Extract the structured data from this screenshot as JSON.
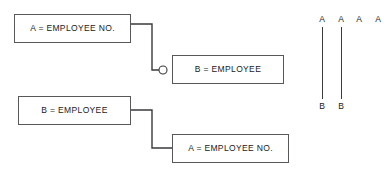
{
  "figure": {
    "name": "entity-relationship-figure",
    "background_color": "#ffffff",
    "line_color": "#3a3a3c",
    "box_border_color": "#58585a",
    "text_color": "#1a1a1a"
  },
  "diagrams": [
    {
      "name": "relationship-diagram-one",
      "parent_box": {
        "label": "A = EMPLOYEE NO.",
        "x": 14,
        "y": 14,
        "width": 117,
        "height": 29
      },
      "child_box": {
        "label": "B = EMPLOYEE",
        "x": 172,
        "y": 55,
        "width": 112,
        "height": 29
      },
      "connector": {
        "path": "M 131 24 L 152 24 L 152 70 L 163 70",
        "marker": {
          "type": "open-circle",
          "cx": 163,
          "cy": 70,
          "r": 4
        }
      }
    },
    {
      "name": "relationship-diagram-two",
      "parent_box": {
        "label": "B = EMPLOYEE",
        "x": 18,
        "y": 96,
        "width": 113,
        "height": 29
      },
      "child_box": {
        "label": "A = EMPLOYEE NO.",
        "x": 172,
        "y": 134,
        "width": 117,
        "height": 29
      },
      "connector": {
        "path": "M 131 110 L 152 110 L 152 148 L 172 148",
        "marker": null
      }
    }
  ],
  "ladder_diagram": {
    "name": "occurrence-ladder-diagram",
    "top_labels": [
      {
        "text": "A",
        "x": 322
      },
      {
        "text": "A",
        "x": 341
      },
      {
        "text": "A",
        "x": 359
      },
      {
        "text": "A",
        "x": 378
      }
    ],
    "bottom_labels": [
      {
        "text": "B",
        "x": 322
      },
      {
        "text": "B",
        "x": 341
      }
    ],
    "lines": [
      {
        "x": 322,
        "y_top": 27,
        "y_bottom": 99
      },
      {
        "x": 341,
        "y_top": 27,
        "y_bottom": 99
      }
    ],
    "label_top_y": 15,
    "label_bottom_y": 102
  }
}
